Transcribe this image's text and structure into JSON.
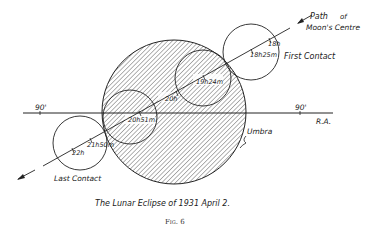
{
  "figure": {
    "caption": "The Lunar Eclipse of 1931 April 2.",
    "figure_label": "Fig. 6"
  },
  "labels": {
    "path_line1": "Path",
    "path_line2": "of",
    "path_line3": "Moon's Centre",
    "first_contact": "First Contact",
    "last_contact": "Last Contact",
    "umbra": "Umbra",
    "ra": "R.A.",
    "ra_left_tick": "90'",
    "ra_right_tick": "90'"
  },
  "times": {
    "t18h": "18h",
    "t18h25m": "18h25m",
    "t19h24m": "19h24m",
    "t20h": "20h",
    "t20h51m": "20h51m",
    "t21h50m": "21h50m",
    "t22h": "22h"
  },
  "colors": {
    "line": "#222222",
    "hatch": "#444444",
    "background": "#ffffff"
  }
}
